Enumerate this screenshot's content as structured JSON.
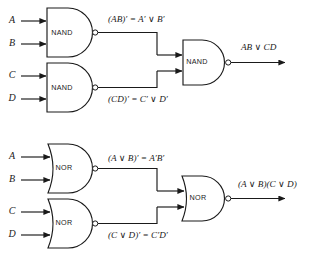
{
  "figure": {
    "background_color": "#ffffff",
    "line_color": "#1a1a1a"
  },
  "circuits": [
    {
      "id": "nand-circuit",
      "gate_type": "NAND",
      "inputs": [
        {
          "label": "A",
          "name": "input-a"
        },
        {
          "label": "B",
          "name": "input-b"
        },
        {
          "label": "C",
          "name": "input-c"
        },
        {
          "label": "D",
          "name": "input-d"
        }
      ],
      "gates": [
        {
          "label": "NAND",
          "name": "gate-nand-top"
        },
        {
          "label": "NAND",
          "name": "gate-nand-bottom"
        },
        {
          "label": "NAND",
          "name": "gate-nand-output"
        }
      ],
      "intermediate_labels": [
        {
          "text": "(AB)′ = A′ ∨ B′",
          "name": "label-ab-complement"
        },
        {
          "text": "(CD)′ = C′ ∨ D′",
          "name": "label-cd-complement"
        }
      ],
      "output_label": {
        "text": "AB ∨ CD",
        "name": "label-output-nand"
      }
    },
    {
      "id": "nor-circuit",
      "gate_type": "NOR",
      "inputs": [
        {
          "label": "A",
          "name": "input-a"
        },
        {
          "label": "B",
          "name": "input-b"
        },
        {
          "label": "C",
          "name": "input-c"
        },
        {
          "label": "D",
          "name": "input-d"
        }
      ],
      "gates": [
        {
          "label": "NOR",
          "name": "gate-nor-top"
        },
        {
          "label": "NOR",
          "name": "gate-nor-bottom"
        },
        {
          "label": "NOR",
          "name": "gate-nor-output"
        }
      ],
      "intermediate_labels": [
        {
          "text": "(A ∨ B)′ = A′B′",
          "name": "label-aorb-complement"
        },
        {
          "text": "(C ∨ D)′ = C′D′",
          "name": "label-corD-complement"
        }
      ],
      "output_label": {
        "text": "(A ∨ B)(C ∨ D)",
        "name": "label-output-nor"
      }
    }
  ]
}
